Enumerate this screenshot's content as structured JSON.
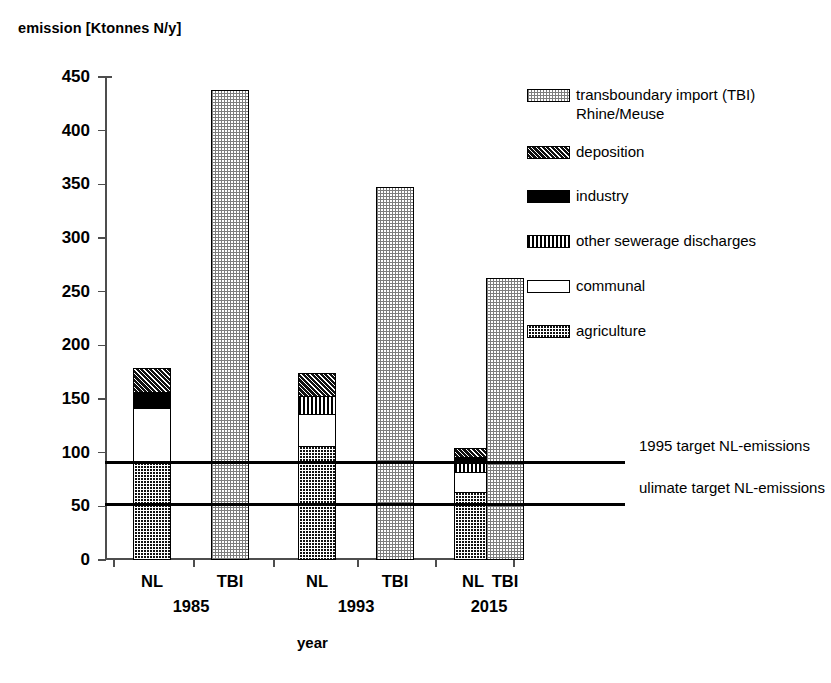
{
  "chart_data": {
    "type": "bar",
    "subtype": "stacked-bar",
    "title": "",
    "ylabel": "emission [Ktonnes N/y]",
    "xlabel": "year",
    "ylim": [
      0,
      450
    ],
    "ytick_step": 50,
    "ytick_labels": [
      "0",
      "50",
      "100",
      "150",
      "200",
      "250",
      "300",
      "350",
      "400",
      "450"
    ],
    "ytick_values": [
      0,
      50,
      100,
      150,
      200,
      250,
      300,
      350,
      400,
      450
    ],
    "grid": false,
    "legend_position": "right",
    "groups": [
      "1985",
      "1993",
      "2015"
    ],
    "categories": [
      "NL",
      "TBI",
      "NL",
      "TBI",
      "NL",
      "TBI"
    ],
    "series": [
      {
        "name": "agriculture",
        "key": "agriculture",
        "pattern": "p-agriculture",
        "values": [
          90,
          0,
          105,
          0,
          62,
          0
        ]
      },
      {
        "name": "communal",
        "key": "communal",
        "pattern": "p-communal",
        "values": [
          50,
          0,
          29,
          0,
          18,
          0
        ]
      },
      {
        "name": "other sewerage discharges",
        "key": "sewerage",
        "pattern": "p-sewerage",
        "values": [
          0,
          0,
          17,
          0,
          10,
          0
        ]
      },
      {
        "name": "industry",
        "key": "industry",
        "pattern": "p-industry",
        "values": [
          15,
          0,
          0,
          0,
          4,
          0
        ]
      },
      {
        "name": "deposition",
        "key": "deposition",
        "pattern": "p-deposition",
        "values": [
          22,
          0,
          22,
          0,
          9,
          0
        ]
      },
      {
        "name": "transboundary import (TBI) Rhine/Meuse",
        "key": "tbi",
        "pattern": "p-tbi",
        "values": [
          0,
          436,
          0,
          346,
          0,
          261
        ]
      }
    ],
    "bar_totals": [
      177,
      436,
      173,
      346,
      103,
      261
    ],
    "reference_lines": [
      {
        "label": "1995 target NL-emissions",
        "value": 91
      },
      {
        "label": "ulimate target NL-emissions",
        "value": 52
      }
    ],
    "colors": {
      "axis": "#4d4d4d",
      "line": "#000000",
      "industry": "#000000",
      "agriculture": "#111111",
      "deposition": "#111111",
      "communal": "#ffffff",
      "tbi": "#d9d9d9",
      "sewerage": "#000000",
      "background": "#ffffff"
    }
  },
  "legend": {
    "items": [
      {
        "label": "transboundary import (TBI)\nRhine/Meuse",
        "pattern": "p-tbi"
      },
      {
        "label": "deposition",
        "pattern": "p-deposition"
      },
      {
        "label": "industry",
        "pattern": "p-industry"
      },
      {
        "label": "other sewerage discharges",
        "pattern": "p-sewerage"
      },
      {
        "label": "communal",
        "pattern": "p-communal"
      },
      {
        "label": "agriculture",
        "pattern": "p-agriculture"
      }
    ]
  }
}
